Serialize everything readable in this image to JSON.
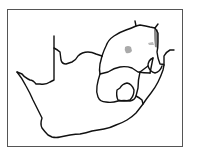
{
  "map": {
    "subject": "South Africa provinces outline",
    "frame_color": "#555555",
    "line_color": "#111111",
    "background": "#ffffff",
    "highlights": [
      {
        "name": "central-patch",
        "color": "#aaaaaa",
        "cx": 129,
        "cy": 50
      },
      {
        "name": "eastern-strip",
        "color": "#888888",
        "cx": 157,
        "cy": 38
      },
      {
        "name": "small-patch",
        "color": "#bbbbbb",
        "cx": 151,
        "cy": 43
      }
    ]
  }
}
